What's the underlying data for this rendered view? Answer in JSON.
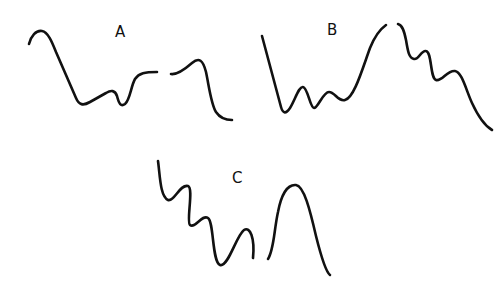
{
  "figure": {
    "background": "#ffffff",
    "stroke_color": "#111111",
    "panels": [
      {
        "label": "A",
        "label_pos": [
          115,
          37
        ],
        "segments": [
          "M29,44 C31,36 36,30 42,31 C48,32 52,42 56,52 L76,98 C79,105 83,106 90,102 L106,93 C111,90 115,90 117,96 C119,104 121,107 125,104 C130,100 131,86 135,79 C139,73 145,72 157,72",
          "M171,74 C177,75 184,70 192,63 C199,57 203,60 206,72 C209,86 211,104 216,112 C220,118 225,120 232,120"
        ]
      },
      {
        "label": "B",
        "label_pos": [
          327,
          35
        ],
        "segments": [
          "M262,36 L281,107 C283,114 286,114 290,108 C295,100 299,86 303,87 C308,88 310,108 314,108 C318,108 323,92 329,92 C335,92 338,102 345,100 C354,98 362,70 370,48 C374,38 379,30 386,25",
          "M398,24 C402,25 404,30 406,40 C408,52 409,58 414,59 C419,60 421,50 426,51 C432,52 430,78 436,80 C442,82 447,70 455,71 C462,72 466,90 472,103 C478,116 485,126 492,130"
        ]
      },
      {
        "label": "C",
        "label_pos": [
          232,
          183
        ],
        "segments": [
          "M158,161 C160,175 160,196 168,200 C174,202 180,184 188,186 C194,188 186,222 190,225 C195,229 202,214 208,218 C214,222 212,262 220,265 C228,268 236,236 244,230 C250,226 255,238 253,258",
          "M268,259 C274,250 274,230 278,212 C281,196 287,184 296,185 C304,186 310,210 316,236 C322,260 326,272 330,275"
        ]
      }
    ]
  }
}
